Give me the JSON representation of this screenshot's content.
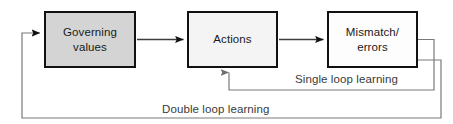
{
  "diagram": {
    "nodes": [
      {
        "id": "governing-values",
        "lines": [
          "Governing",
          "values"
        ],
        "fill": "#d4d4d4",
        "stroke": "#111111"
      },
      {
        "id": "actions",
        "lines": [
          "Actions"
        ],
        "fill": "#f4f4f4",
        "stroke": "#111111"
      },
      {
        "id": "mismatch-errors",
        "lines": [
          "Mismatch/",
          "errors"
        ],
        "fill": "#fdfdfd",
        "stroke": "#111111"
      }
    ],
    "edge_labels": {
      "single_loop": "Single loop learning",
      "double_loop": "Double loop learning"
    },
    "connectors": [
      {
        "id": "governing-to-actions",
        "from": "governing-values",
        "to": "actions",
        "arrow": true
      },
      {
        "id": "actions-to-mismatch",
        "from": "actions",
        "to": "mismatch-errors",
        "arrow": true
      },
      {
        "id": "single-loop-feedback",
        "from": "mismatch-errors",
        "to": "actions",
        "arrow": true
      },
      {
        "id": "double-loop-feedback",
        "from": "mismatch-errors",
        "to": "governing-values",
        "arrow": true
      }
    ],
    "colors": {
      "line": "#555555",
      "arrow": "#111111",
      "box_border": "#111111",
      "text": "#1a1a1a",
      "background": "#ffffff"
    }
  }
}
